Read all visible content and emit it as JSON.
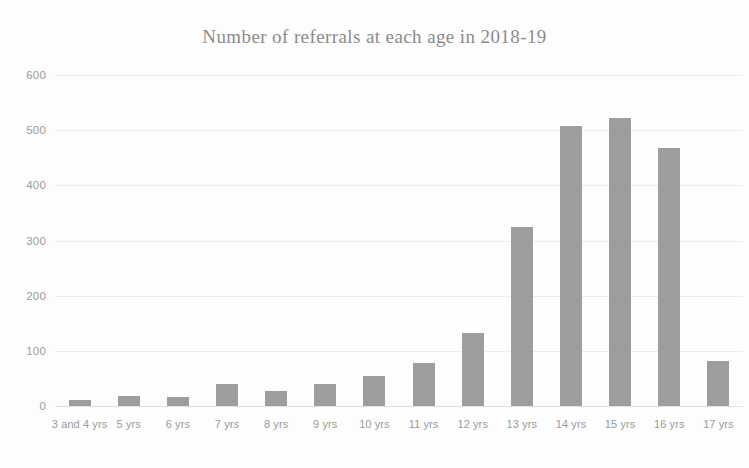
{
  "chart_data": {
    "type": "bar",
    "title": "Number of referrals at each age in 2018-19",
    "xlabel": "",
    "ylabel": "",
    "categories": [
      "3 and 4 yrs",
      "5 yrs",
      "6 yrs",
      "7 yrs",
      "8 yrs",
      "9 yrs",
      "10 yrs",
      "11 yrs",
      "12 yrs",
      "13 yrs",
      "14 yrs",
      "15 yrs",
      "16 yrs",
      "17 yrs"
    ],
    "values": [
      10,
      18,
      17,
      40,
      28,
      40,
      55,
      78,
      133,
      325,
      508,
      522,
      468,
      82
    ],
    "ylim": [
      0,
      600
    ],
    "ytick_labels": [
      "0",
      "100",
      "200",
      "300",
      "400",
      "500",
      "600"
    ],
    "ytick_values": [
      0,
      100,
      200,
      300,
      400,
      500,
      600
    ],
    "grid": true,
    "legend": false,
    "bar_color": "#9d9d9d",
    "grid_color": "#ececec",
    "text_color": "#9a9a9a"
  }
}
